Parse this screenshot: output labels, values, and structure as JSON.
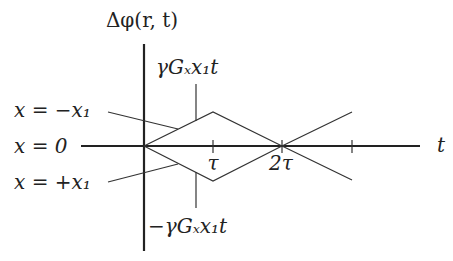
{
  "diagram": {
    "y_axis_label": "Δφ(r, t)",
    "x_axis_label": "t",
    "upper_annotation": "γGₓx₁t",
    "lower_annotation": "−γGₓx₁t",
    "ticks": [
      {
        "label": "τ"
      },
      {
        "label": "2τ"
      },
      {
        "label": ""
      }
    ],
    "curves": [
      {
        "label": "x = −x₁",
        "description": "phase rises linearly to +γGₓx₁τ at τ, returns to 0 at 2τ, then goes negative"
      },
      {
        "label": "x = 0",
        "description": "phase remains 0 (coincides with t-axis)"
      },
      {
        "label": "x = +x₁",
        "description": "phase falls linearly to −γGₓx₁τ at τ, returns to 0 at 2τ, then goes positive"
      }
    ],
    "colors": {
      "line": "#333333",
      "axis": "#222222",
      "background": "#ffffff"
    }
  }
}
